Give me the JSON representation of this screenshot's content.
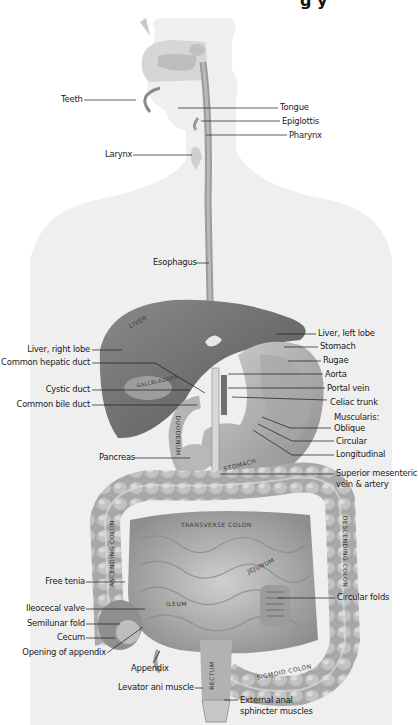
{
  "diagram": {
    "title_fragment": "g y",
    "colors": {
      "background": "#ffffff",
      "silhouette": "#eeeeee",
      "organ_dark": "#6e6e6e",
      "organ_mid": "#9a9a9a",
      "organ_light": "#c4c4c4",
      "leader_line": "#1a1a1a",
      "label_text": "#1a1a1a"
    },
    "labels_left": [
      {
        "id": "teeth",
        "text": "Teeth",
        "x": 60,
        "y": 100
      },
      {
        "id": "larynx",
        "text": "Larynx",
        "x": 106,
        "y": 155
      },
      {
        "id": "esophagus",
        "text": "Esophagus",
        "x": 153,
        "y": 263
      },
      {
        "id": "liver-right-lobe",
        "text": "Liver, right lobe",
        "x": 90,
        "y": 350
      },
      {
        "id": "common-hepatic-duct",
        "text": "Common hepatic duct",
        "x": 90,
        "y": 363
      },
      {
        "id": "cystic-duct",
        "text": "Cystic duct",
        "x": 90,
        "y": 390
      },
      {
        "id": "common-bile-duct",
        "text": "Common bile duct",
        "x": 90,
        "y": 405
      },
      {
        "id": "pancreas",
        "text": "Pancreas",
        "x": 133,
        "y": 458
      },
      {
        "id": "free-tenia",
        "text": "Free tenia",
        "x": 85,
        "y": 582
      },
      {
        "id": "ileocecal-valve",
        "text": "Ileocecal valve",
        "x": 85,
        "y": 609
      },
      {
        "id": "semilunar-fold",
        "text": "Semilunar fold",
        "x": 85,
        "y": 624
      },
      {
        "id": "cecum",
        "text": "Cecum",
        "x": 85,
        "y": 638
      },
      {
        "id": "opening-of-appendix",
        "text": "Opening of appendix",
        "x": 106,
        "y": 653
      },
      {
        "id": "levator-ani-muscle",
        "text": "Levator ani muscle",
        "x": 190,
        "y": 688
      }
    ],
    "labels_right": [
      {
        "id": "tongue",
        "text": "Tongue",
        "x": 280,
        "y": 108
      },
      {
        "id": "epiglottis",
        "text": "Epiglottis",
        "x": 282,
        "y": 123
      },
      {
        "id": "pharynx",
        "text": "Pharynx",
        "x": 289,
        "y": 138
      },
      {
        "id": "liver-left-lobe",
        "text": "Liver, left lobe",
        "x": 318,
        "y": 334
      },
      {
        "id": "stomach",
        "text": "Stomach",
        "x": 320,
        "y": 347
      },
      {
        "id": "rugae",
        "text": "Rugae",
        "x": 323,
        "y": 362
      },
      {
        "id": "aorta",
        "text": "Aorta",
        "x": 325,
        "y": 376
      },
      {
        "id": "portal-vein",
        "text": "Portal vein",
        "x": 327,
        "y": 390
      },
      {
        "id": "celiac-trunk",
        "text": "Celiac trunk",
        "x": 330,
        "y": 403
      },
      {
        "id": "muscularis",
        "text": "Muscularis:",
        "x": 333,
        "y": 419
      },
      {
        "id": "oblique",
        "text": "Oblique",
        "x": 333,
        "y": 429
      },
      {
        "id": "circular",
        "text": "Circular",
        "x": 336,
        "y": 443
      },
      {
        "id": "longitudinal",
        "text": "Longitudinal",
        "x": 336,
        "y": 457
      },
      {
        "id": "superior-mesenteric",
        "text": "Superior mesenteric",
        "x": 336,
        "y": 474
      },
      {
        "id": "superior-mesenteric-2",
        "text": "vein & artery",
        "x": 336,
        "y": 485
      },
      {
        "id": "circular-folds",
        "text": "Circular folds",
        "x": 337,
        "y": 598
      },
      {
        "id": "external-anal",
        "text": "External anal",
        "x": 240,
        "y": 696
      },
      {
        "id": "external-anal-2",
        "text": "sphincter muscles",
        "x": 240,
        "y": 707
      },
      {
        "id": "appendix",
        "text": "Appendix",
        "x": 131,
        "y": 667
      }
    ],
    "organ_text": {
      "liver": "Liver",
      "gallbladder": "Gallbladder",
      "duodenum": "Duodenum",
      "stomach": "Stomach",
      "transverse_colon": "Transverse colon",
      "descending_colon": "Descending colon",
      "ascending_colon": "Ascending colon",
      "jejunum": "Jejunum",
      "ileum": "Ileum",
      "cecum": "Cecum",
      "rectum": "Rectum",
      "sigmoid_colon": "Sigmoid colon"
    }
  }
}
